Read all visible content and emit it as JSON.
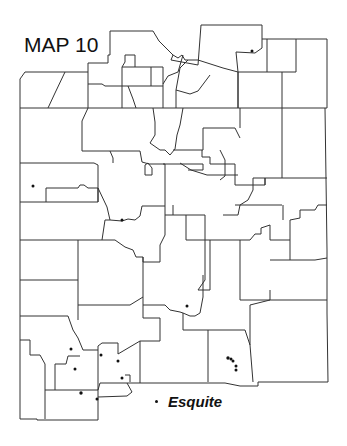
{
  "title": "MAP 10",
  "legend": {
    "symbol": "dot",
    "label": "Esquite"
  },
  "colors": {
    "border": "#333333",
    "dot": "#111111",
    "background": "#ffffff"
  },
  "points": [
    [
      252,
      51
    ],
    [
      33,
      186
    ],
    [
      122,
      220
    ],
    [
      187,
      306
    ],
    [
      71,
      349
    ],
    [
      75,
      369
    ],
    [
      101,
      355
    ],
    [
      118,
      361
    ],
    [
      122,
      378
    ],
    [
      81,
      393
    ],
    [
      97,
      399
    ],
    [
      229,
      358
    ],
    [
      232,
      359
    ],
    [
      234,
      362
    ],
    [
      236,
      366
    ],
    [
      236,
      370
    ]
  ]
}
